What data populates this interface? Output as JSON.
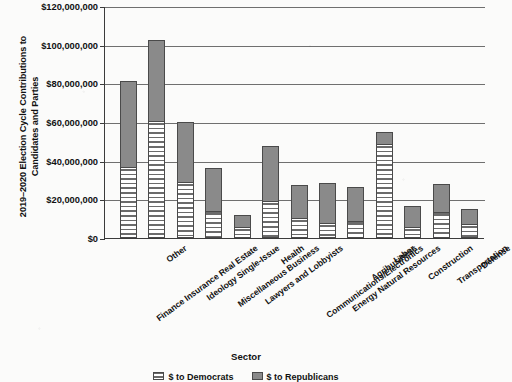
{
  "chart_data": {
    "type": "bar",
    "subtype": "stacked-vertical",
    "title": "",
    "xlabel": "Sector",
    "ylabel": "2019–2020 Election Cycle Contributions to Candidates and Parties",
    "ylim": [
      0,
      120000000
    ],
    "ytick_step": 20000000,
    "ytick_labels": [
      "$120,000,000",
      "$100,000,000",
      "$80,000,000",
      "$60,000,000",
      "$40,000,000",
      "$20,000,000",
      "$0"
    ],
    "ytick_values": [
      120000000,
      100000000,
      80000000,
      60000000,
      40000000,
      20000000,
      0
    ],
    "grid": "horizontal",
    "legend_position": "bottom",
    "categories": [
      "Finance Insurance Real Estate",
      "Other",
      "Ideology Single-Issue",
      "Miscellaneous Business",
      "Lawyers and Lobbyists",
      "Health",
      "Communications/Electronics",
      "Energy Natural Resources",
      "Agribusiness",
      "Labor",
      "Construction",
      "Transportation",
      "Defense"
    ],
    "series": [
      {
        "name": "$ to Democrats",
        "pattern": "horizontal-stripes",
        "color": "#ffffff",
        "values": [
          36500000,
          60500000,
          29000000,
          14000000,
          5500000,
          19000000,
          10500000,
          8000000,
          9000000,
          48500000,
          5500000,
          13500000,
          7000000
        ]
      },
      {
        "name": "$ to Republicans",
        "pattern": "solid-gray",
        "color": "#8a8a8a",
        "values": [
          44500000,
          42000000,
          31000000,
          22000000,
          6500000,
          28500000,
          17000000,
          20500000,
          17500000,
          6500000,
          11000000,
          14500000,
          8000000
        ]
      }
    ],
    "totals": [
      81000000,
      102500000,
      60000000,
      36000000,
      12000000,
      47500000,
      27500000,
      28500000,
      26500000,
      55000000,
      16500000,
      28000000,
      15000000
    ]
  },
  "legend": {
    "items": [
      {
        "label": "$ to Democrats",
        "swatch": "dem"
      },
      {
        "label": "$ to Republicans",
        "swatch": "rep"
      }
    ]
  }
}
